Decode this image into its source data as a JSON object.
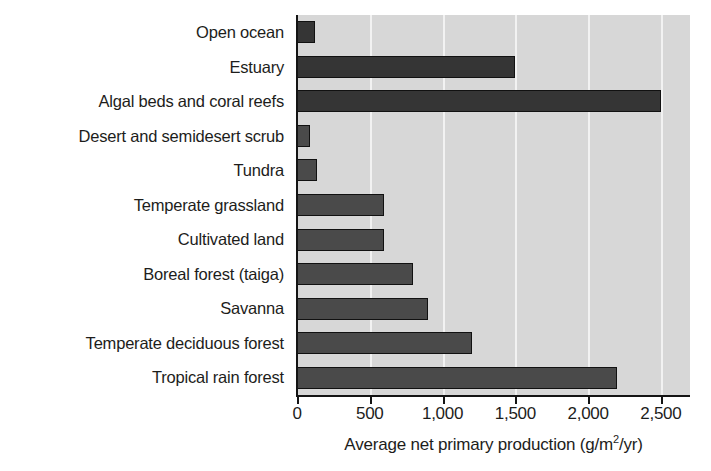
{
  "chart_data": {
    "type": "bar",
    "orientation": "horizontal",
    "title": "",
    "xlabel": "Average net primary production (g/m2/yr)",
    "xlabel_prefix": "Average net primary production (g/m",
    "xlabel_superscript": "2",
    "xlabel_suffix": "/yr)",
    "ylabel": "",
    "xlim": [
      0,
      2700
    ],
    "grid": true,
    "legend": "none",
    "xticks": [
      0,
      500,
      1000,
      1500,
      2000,
      2500
    ],
    "xticklabels": [
      "0",
      "500",
      "1,000",
      "1,500",
      "2,000",
      "2,500"
    ],
    "categories": [
      "Open ocean",
      "Estuary",
      "Algal beds and coral reefs",
      "Desert and semidesert scrub",
      "Tundra",
      "Temperate grassland",
      "Cultivated land",
      "Boreal forest (taiga)",
      "Savanna",
      "Temperate deciduous forest",
      "Tropical rain forest"
    ],
    "values": [
      125,
      1500,
      2500,
      90,
      140,
      600,
      600,
      800,
      900,
      1200,
      2200
    ],
    "bars": [
      {
        "label": "Open ocean",
        "value": 125,
        "shade": "dark"
      },
      {
        "label": "Estuary",
        "value": 1500,
        "shade": "dark"
      },
      {
        "label": "Algal beds and coral reefs",
        "value": 2500,
        "shade": "dark"
      },
      {
        "label": "Desert and semidesert scrub",
        "value": 90,
        "shade": "normal"
      },
      {
        "label": "Tundra",
        "value": 140,
        "shade": "normal"
      },
      {
        "label": "Temperate grassland",
        "value": 600,
        "shade": "normal"
      },
      {
        "label": "Cultivated land",
        "value": 600,
        "shade": "normal"
      },
      {
        "label": "Boreal forest (taiga)",
        "value": 800,
        "shade": "normal"
      },
      {
        "label": "Savanna",
        "value": 900,
        "shade": "normal"
      },
      {
        "label": "Temperate deciduous forest",
        "value": 1200,
        "shade": "normal"
      },
      {
        "label": "Tropical rain forest",
        "value": 2200,
        "shade": "normal"
      }
    ],
    "colors": {
      "plot_background": "#d7d7d7",
      "bar_fill": "#4a4a4a",
      "bar_fill_dark": "#353535",
      "bar_edge": "#111111",
      "gridline": "#f2f2f2",
      "axis": "#141414",
      "text": "#1d1d1b",
      "page_background": "#ffffff"
    }
  }
}
